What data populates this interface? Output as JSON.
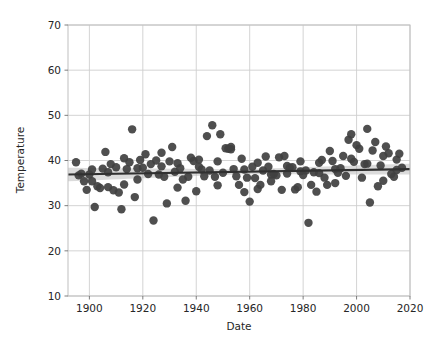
{
  "chart_data": {
    "type": "scatter",
    "title": "",
    "xlabel": "Date",
    "ylabel": "Temperature",
    "xlim": [
      1892,
      2020
    ],
    "ylim": [
      10,
      70
    ],
    "xticks": [
      1900,
      1920,
      1940,
      1960,
      1980,
      2000,
      2020
    ],
    "yticks": [
      10,
      20,
      30,
      40,
      50,
      60,
      70
    ],
    "grid": true,
    "legend": "none",
    "marker_color": "#404040",
    "marker_size": 4.2,
    "regression": {
      "type": "linear-fit-with-ci-band",
      "line_color": "#303030",
      "band_color": "#b0b0b0",
      "x_start": 1892,
      "x_end": 2020,
      "y_start": 36.9,
      "y_end": 38.1,
      "band_halfwidth_start": 1.5,
      "band_halfwidth_mid": 0.55,
      "band_halfwidth_end": 1.2
    },
    "points": [
      [
        1895,
        39.6
      ],
      [
        1896,
        36.7
      ],
      [
        1897,
        37.1
      ],
      [
        1898,
        35.4
      ],
      [
        1899,
        33.5
      ],
      [
        1900,
        36.9
      ],
      [
        1901,
        35.4
      ],
      [
        1902,
        29.7
      ],
      [
        1903,
        34.3
      ],
      [
        1904,
        33.9
      ],
      [
        1905,
        38.2
      ],
      [
        1906,
        41.9
      ],
      [
        1907,
        34.1
      ],
      [
        1908,
        39.2
      ],
      [
        1909,
        33.4
      ],
      [
        1910,
        38.5
      ],
      [
        1911,
        32.9
      ],
      [
        1912,
        29.2
      ],
      [
        1913,
        40.5
      ],
      [
        1914,
        38.1
      ],
      [
        1915,
        39.6
      ],
      [
        1916,
        46.9
      ],
      [
        1917,
        31.9
      ],
      [
        1918,
        38.3
      ],
      [
        1919,
        40.1
      ],
      [
        1920,
        38.4
      ],
      [
        1921,
        41.4
      ],
      [
        1922,
        37.0
      ],
      [
        1923,
        39.2
      ],
      [
        1924,
        26.7
      ],
      [
        1925,
        40.0
      ],
      [
        1926,
        36.9
      ],
      [
        1927,
        41.7
      ],
      [
        1928,
        36.4
      ],
      [
        1929,
        30.5
      ],
      [
        1930,
        39.8
      ],
      [
        1931,
        43.0
      ],
      [
        1932,
        37.5
      ],
      [
        1933,
        39.4
      ],
      [
        1934,
        38.3
      ],
      [
        1935,
        35.8
      ],
      [
        1936,
        31.1
      ],
      [
        1937,
        36.4
      ],
      [
        1938,
        40.6
      ],
      [
        1939,
        39.9
      ],
      [
        1940,
        33.2
      ],
      [
        1941,
        40.2
      ],
      [
        1942,
        38.0
      ],
      [
        1943,
        36.5
      ],
      [
        1944,
        45.4
      ],
      [
        1945,
        37.8
      ],
      [
        1946,
        47.8
      ],
      [
        1947,
        36.4
      ],
      [
        1948,
        34.5
      ],
      [
        1949,
        45.8
      ],
      [
        1950,
        37.3
      ],
      [
        1951,
        42.7
      ],
      [
        1952,
        42.6
      ],
      [
        1953,
        42.5
      ],
      [
        1954,
        38.1
      ],
      [
        1955,
        36.5
      ],
      [
        1956,
        34.6
      ],
      [
        1957,
        40.4
      ],
      [
        1958,
        33.0
      ],
      [
        1959,
        36.2
      ],
      [
        1960,
        30.9
      ],
      [
        1961,
        38.6
      ],
      [
        1962,
        36.1
      ],
      [
        1963,
        33.7
      ],
      [
        1964,
        34.6
      ],
      [
        1965,
        37.8
      ],
      [
        1966,
        40.9
      ],
      [
        1967,
        38.6
      ],
      [
        1968,
        35.4
      ],
      [
        1969,
        37.0
      ],
      [
        1970,
        36.7
      ],
      [
        1971,
        40.7
      ],
      [
        1972,
        33.5
      ],
      [
        1973,
        41.0
      ],
      [
        1974,
        38.8
      ],
      [
        1975,
        38.4
      ],
      [
        1976,
        38.5
      ],
      [
        1977,
        33.6
      ],
      [
        1978,
        34.1
      ],
      [
        1979,
        37.6
      ],
      [
        1980,
        36.8
      ],
      [
        1981,
        37.8
      ],
      [
        1982,
        26.2
      ],
      [
        1983,
        34.6
      ],
      [
        1984,
        37.4
      ],
      [
        1985,
        33.1
      ],
      [
        1986,
        39.5
      ],
      [
        1987,
        40.1
      ],
      [
        1988,
        36.2
      ],
      [
        1989,
        34.6
      ],
      [
        1990,
        42.1
      ],
      [
        1991,
        39.9
      ],
      [
        1992,
        35.0
      ],
      [
        1993,
        37.3
      ],
      [
        1994,
        38.3
      ],
      [
        1995,
        41.0
      ],
      [
        1996,
        36.6
      ],
      [
        1997,
        44.6
      ],
      [
        1998,
        45.8
      ],
      [
        1999,
        39.7
      ],
      [
        2000,
        43.4
      ],
      [
        2001,
        42.6
      ],
      [
        2002,
        36.2
      ],
      [
        2003,
        39.2
      ],
      [
        2004,
        47.0
      ],
      [
        2005,
        30.7
      ],
      [
        2006,
        42.2
      ],
      [
        2007,
        44.1
      ],
      [
        2008,
        34.3
      ],
      [
        2009,
        38.9
      ],
      [
        2010,
        35.5
      ],
      [
        2011,
        43.1
      ],
      [
        2012,
        41.6
      ],
      [
        2013,
        37.0
      ],
      [
        2014,
        36.4
      ],
      [
        2015,
        40.2
      ],
      [
        2016,
        41.5
      ],
      [
        2017,
        38.4
      ],
      [
        1901,
        38.0
      ],
      [
        1907,
        37.4
      ],
      [
        1913,
        34.7
      ],
      [
        1918,
        35.8
      ],
      [
        1927,
        38.7
      ],
      [
        1933,
        34.0
      ],
      [
        1941,
        38.6
      ],
      [
        1948,
        39.8
      ],
      [
        1953,
        43.0
      ],
      [
        1958,
        38.0
      ],
      [
        1963,
        39.5
      ],
      [
        1968,
        36.9
      ],
      [
        1974,
        37.1
      ],
      [
        1979,
        39.8
      ],
      [
        1986,
        37.2
      ],
      [
        1992,
        38.1
      ],
      [
        1998,
        40.4
      ],
      [
        2004,
        39.3
      ],
      [
        2010,
        41.0
      ],
      [
        2015,
        37.9
      ]
    ]
  }
}
